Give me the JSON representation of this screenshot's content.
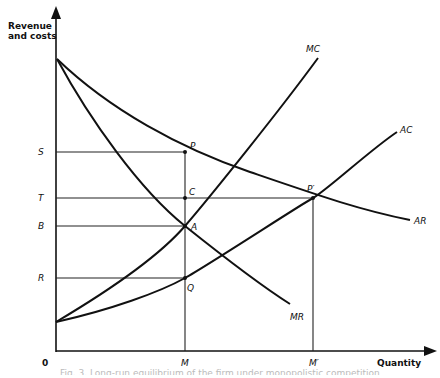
{
  "chart_data": {
    "type": "line",
    "title": "",
    "ylabel_line1": "Revenue",
    "ylabel_line2": "and costs",
    "xlabel": "Quantity",
    "origin_label": "0",
    "grid": false,
    "x_ticks": [
      {
        "label": "M",
        "x": 185
      },
      {
        "label": "M′",
        "x": 313
      }
    ],
    "y_ticks": [
      {
        "label": "S",
        "y": 152
      },
      {
        "label": "T",
        "y": 198
      },
      {
        "label": "B",
        "y": 226
      },
      {
        "label": "R",
        "y": 278
      }
    ],
    "series": [
      {
        "name": "AR",
        "label": "AR",
        "path": "M57,59 C110,110 180,148 250,172 S360,210 410,220",
        "label_pos": [
          414,
          224
        ]
      },
      {
        "name": "MR",
        "label": "MR",
        "path": "M57,59 C90,120 140,190 185,226 S260,285 290,304",
        "label_pos": [
          290,
          320
        ]
      },
      {
        "name": "MC",
        "label": "MC",
        "path": "M56,322 C110,290 160,255 185,226 S280,110 318,58",
        "label_pos": [
          306,
          52
        ]
      },
      {
        "name": "AC",
        "label": "AC",
        "path": "M56,322 C110,310 160,292 185,278 S300,205 313,198 S370,150 397,132",
        "label_pos": [
          400,
          133
        ]
      }
    ],
    "points": [
      {
        "label": "P",
        "x": 185,
        "y": 152,
        "lx": 190,
        "ly": 149
      },
      {
        "label": "C",
        "x": 185,
        "y": 198,
        "lx": 189,
        "ly": 195
      },
      {
        "label": "A",
        "x": 185,
        "y": 226,
        "lx": 191,
        "ly": 230
      },
      {
        "label": "Q",
        "x": 185,
        "y": 278,
        "lx": 187,
        "ly": 291
      },
      {
        "label": "P′",
        "x": 313,
        "y": 198,
        "lx": 307,
        "ly": 192
      }
    ],
    "caption": "Fig. 3.  Long-run equilibrium of the firm under monopolistic competition"
  }
}
